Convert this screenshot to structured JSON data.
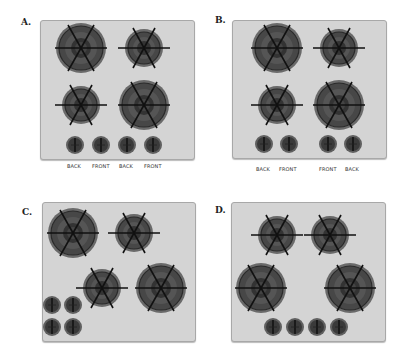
{
  "colors": {
    "panel": "#d4d4d4",
    "burner_outer": "#5a5a5a",
    "burner_inner": "#3a3a3a",
    "grate": "#1a1a1a",
    "knob": "#4a4a4a"
  },
  "options": [
    {
      "label": "A.",
      "knob_labels": [
        "BACK",
        "FRONT",
        "BACK",
        "FRONT"
      ]
    },
    {
      "label": "B.",
      "knob_labels": [
        "BACK",
        "FRONT",
        "FRONT",
        "BACK"
      ]
    },
    {
      "label": "C.",
      "knob_labels": []
    },
    {
      "label": "D.",
      "knob_labels": []
    }
  ]
}
